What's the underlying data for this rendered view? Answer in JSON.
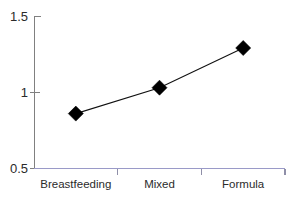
{
  "chart_data": {
    "type": "line",
    "title": "",
    "xlabel": "",
    "ylabel": "",
    "categories": [
      "Breastfeeding",
      "Mixed",
      "Formula"
    ],
    "values": [
      0.86,
      1.03,
      1.29
    ],
    "series": [
      {
        "name": "",
        "values": [
          0.86,
          1.03,
          1.29
        ]
      }
    ],
    "ylim": [
      0.5,
      1.5
    ],
    "ytick_labels": [
      "0.5",
      "1",
      "1.5"
    ],
    "ytick_values": [
      0.5,
      1.0,
      1.5
    ],
    "grid": false,
    "legend": false,
    "legend_position": "none",
    "marker": "diamond",
    "marker_color": "#000000",
    "line_color": "#111111",
    "x_axis_color": "#9a9ac8",
    "y_axis_color": "#808080",
    "background_color": "#ffffff"
  },
  "axis": {
    "y_labels": [
      {
        "text": "1.5",
        "value": 1.5
      },
      {
        "text": "1",
        "value": 1.0
      },
      {
        "text": "0.5",
        "value": 0.5
      }
    ],
    "x_labels": [
      {
        "text": "Breastfeeding"
      },
      {
        "text": "Mixed"
      },
      {
        "text": "Formula"
      }
    ]
  }
}
